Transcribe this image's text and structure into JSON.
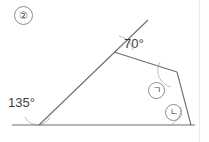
{
  "problem": {
    "number": "②"
  },
  "figure": {
    "type": "geometry-diagram",
    "stroke_color": "#6e6e6e",
    "arc_color": "#b9b9b9",
    "baseline": {
      "x1": 12,
      "y1": 125,
      "x2": 195,
      "y2": 125
    },
    "vertices": {
      "base_left_vertex": {
        "x": 39,
        "y": 125
      },
      "upper_vertex": {
        "x": 114,
        "y": 52
      },
      "ray_tip": {
        "x": 148,
        "y": 20
      },
      "right_upper_vertex": {
        "x": 177,
        "y": 72
      },
      "base_right_vertex": {
        "x": 191,
        "y": 125
      }
    },
    "angles": [
      {
        "name": "angle-70",
        "label": "70°",
        "vertex": "upper_vertex"
      },
      {
        "name": "angle-135",
        "label": "135°",
        "vertex": "base_left_vertex"
      },
      {
        "name": "angle-giyeok",
        "label": "㉠",
        "symbol": "ㄱ",
        "vertex": "right_upper_vertex"
      },
      {
        "name": "angle-nieun",
        "label": "㉡",
        "symbol": "ㄴ",
        "vertex": "base_right_vertex"
      }
    ]
  },
  "labels": {
    "angle_70": "70°",
    "angle_135": "135°",
    "symbol_a": "ㄱ",
    "symbol_b": "ㄴ"
  }
}
